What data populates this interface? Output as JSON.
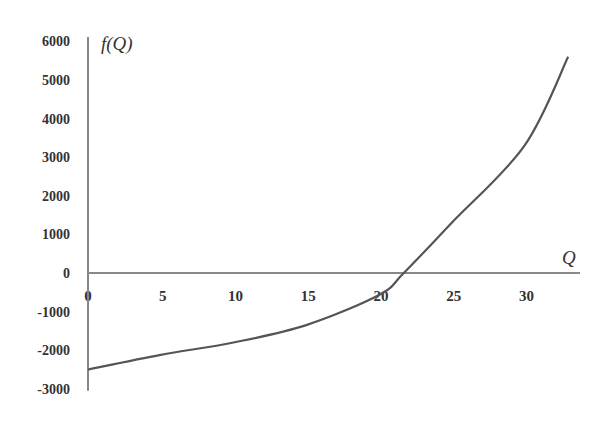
{
  "chart_data": {
    "type": "line",
    "title": "",
    "xlabel": "Q",
    "ylabel": "f(Q)",
    "xlim": [
      0,
      34
    ],
    "ylim": [
      -3000,
      6000
    ],
    "grid": false,
    "legend": null,
    "x_ticks": [
      0,
      5,
      10,
      15,
      20,
      25,
      30
    ],
    "y_ticks": [
      -3000,
      -2000,
      -1000,
      0,
      1000,
      2000,
      3000,
      4000,
      5000,
      6000
    ],
    "x_tick_labels": [
      "0",
      "5",
      "10",
      "15",
      "20",
      "25",
      "30"
    ],
    "y_tick_labels": [
      "-3000",
      "-2000",
      "-1000",
      "0",
      "1000",
      "2000",
      "3000",
      "4000",
      "5000",
      "6000"
    ],
    "series": [
      {
        "name": "f(Q)",
        "color": "#555555",
        "x": [
          0,
          5,
          10,
          15,
          20,
          21.7,
          25,
          30,
          33
        ],
        "y": [
          -2500,
          -2120,
          -1800,
          -1350,
          -570,
          0,
          1300,
          3300,
          5600
        ]
      }
    ],
    "annotations": [
      "root near Q ≈ 21.7"
    ]
  },
  "axis": {
    "color": "#888888",
    "curve_color": "#555555"
  }
}
